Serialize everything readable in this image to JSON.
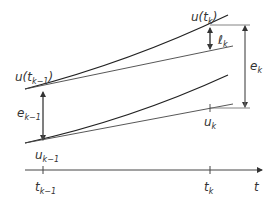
{
  "diagram": {
    "type": "local-truncation-error-illustration",
    "axis": {
      "label": "t"
    },
    "ticks": [
      {
        "base": "t",
        "sub": "k−1"
      },
      {
        "base": "t",
        "sub": "k"
      }
    ],
    "labels": {
      "u_tk_minus1": {
        "pre": "u(t",
        "sub": "k−1",
        "post": ")"
      },
      "u_tk": {
        "pre": "u(t",
        "sub": "k",
        "post": ")"
      },
      "ell_k": {
        "base": "ℓ",
        "sub": "k"
      },
      "e_k": {
        "base": "e",
        "sub": "k"
      },
      "e_k_minus1": {
        "base": "e",
        "sub": "k−1"
      },
      "u_k": {
        "base": "u",
        "sub": "k"
      },
      "u_k_minus1": {
        "base": "u",
        "sub": "k−1"
      }
    },
    "colors": {
      "curve": "#222222",
      "tangent": "#444444",
      "arrow": "#444444",
      "axis": "#444444",
      "text": "#333333"
    }
  }
}
